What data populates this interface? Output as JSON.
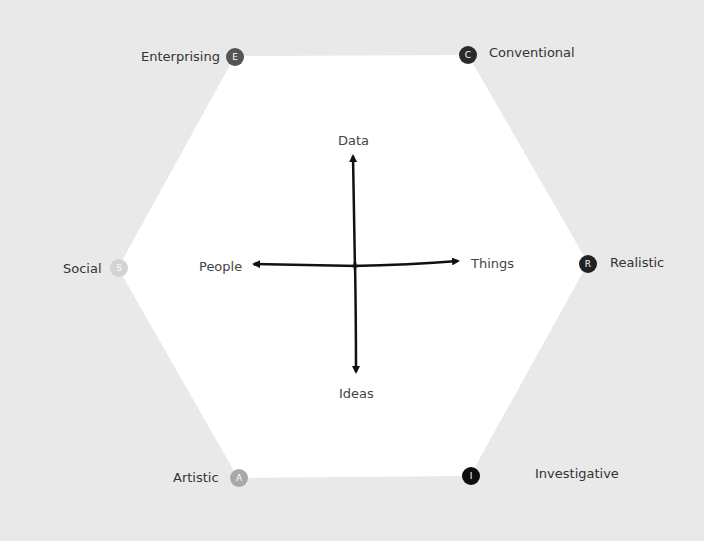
{
  "diagram": {
    "type": "RIASEC hexagon",
    "colors": {
      "background": "#e9e9e9",
      "hexagon_fill": "#ffffff",
      "axis": "#111111"
    },
    "types": [
      {
        "key": "E",
        "label": "Enterprising",
        "badge_color": "#555555"
      },
      {
        "key": "C",
        "label": "Conventional",
        "badge_color": "#2b2b2b"
      },
      {
        "key": "R",
        "label": "Realistic",
        "badge_color": "#222222"
      },
      {
        "key": "I",
        "label": "Investigative",
        "badge_color": "#0d0d0d"
      },
      {
        "key": "A",
        "label": "Artistic",
        "badge_color": "#a9a9a9"
      },
      {
        "key": "S",
        "label": "Social",
        "badge_color": "#d3d3d3"
      }
    ],
    "axes": {
      "top": "Data",
      "bottom": "Ideas",
      "left": "People",
      "right": "Things"
    }
  }
}
